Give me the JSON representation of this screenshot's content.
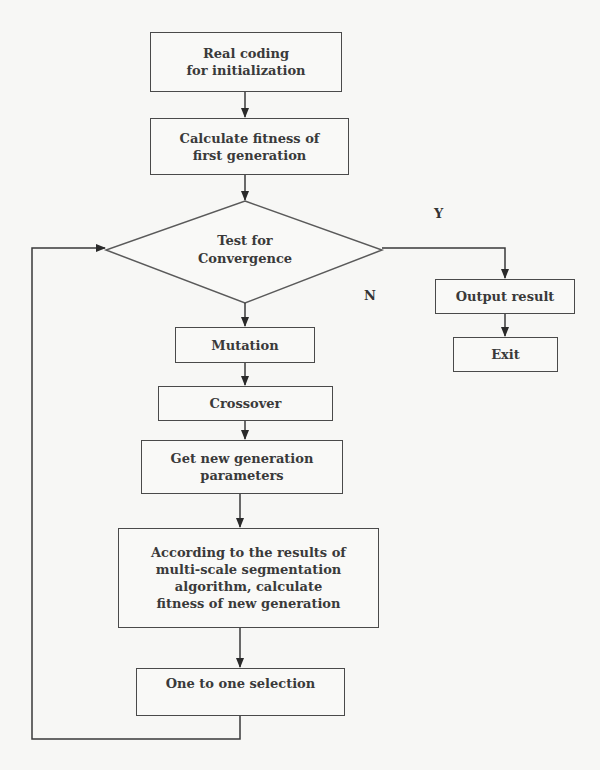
{
  "diagram": {
    "type": "flowchart",
    "nodes": {
      "init": {
        "lines": [
          "Real coding",
          "for initialization"
        ]
      },
      "fitness_first": {
        "lines": [
          "Calculate fitness of",
          "first generation"
        ]
      },
      "convergence": {
        "lines": [
          "Test for",
          "Convergence"
        ],
        "shape": "diamond"
      },
      "output": {
        "lines": [
          "Output result"
        ]
      },
      "exit": {
        "lines": [
          "Exit"
        ]
      },
      "mutation": {
        "lines": [
          "Mutation"
        ]
      },
      "crossover": {
        "lines": [
          "Crossover"
        ]
      },
      "new_params": {
        "lines": [
          "Get new generation",
          "parameters"
        ]
      },
      "fitness_new": {
        "lines": [
          "According to the results of",
          "multi-scale segmentation",
          "algorithm, calculate",
          "fitness of new generation"
        ]
      },
      "selection": {
        "lines": [
          "One to one selection"
        ]
      }
    },
    "edge_labels": {
      "yes": "Y",
      "no": "N"
    },
    "edges": [
      [
        "init",
        "fitness_first"
      ],
      [
        "fitness_first",
        "convergence"
      ],
      [
        "convergence",
        "output",
        "Y"
      ],
      [
        "output",
        "exit"
      ],
      [
        "convergence",
        "mutation",
        "N"
      ],
      [
        "mutation",
        "crossover"
      ],
      [
        "crossover",
        "new_params"
      ],
      [
        "new_params",
        "fitness_new"
      ],
      [
        "fitness_new",
        "selection"
      ],
      [
        "selection",
        "convergence"
      ]
    ]
  }
}
